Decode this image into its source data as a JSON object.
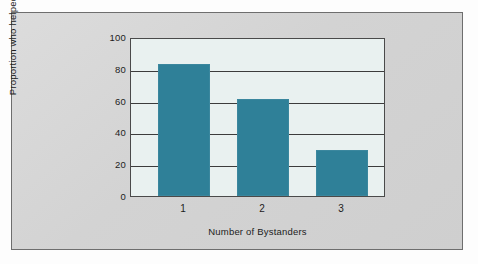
{
  "chart_data": {
    "type": "bar",
    "title": "",
    "subtitle": "",
    "categories": [
      "1",
      "2",
      "3"
    ],
    "values": [
      84,
      62,
      29
    ],
    "series": [
      {
        "name": "Proportion who helped",
        "values": [
          84,
          62,
          29
        ]
      }
    ],
    "xlabel": "Number of Bystanders",
    "ylabel": "Proportion who helped",
    "yticks": [
      "100",
      "80",
      "60",
      "40",
      "20",
      "0"
    ],
    "ytick_values": [
      100,
      80,
      60,
      40,
      20,
      0
    ],
    "xtick_labels": [
      "1",
      "2",
      "3"
    ],
    "ylim": [
      0,
      100
    ],
    "grid": "horizontal",
    "legend": "none",
    "bar_color": "#2f8098",
    "plot_background": "#e9f1f0",
    "axis_color": "#3c3c3c",
    "frame_background": "#d6d6d6",
    "annotations": []
  }
}
